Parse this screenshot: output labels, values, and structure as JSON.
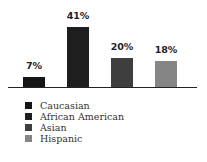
{
  "chart_data": {
    "type": "bar",
    "title": "",
    "xlabel": "",
    "ylabel": "",
    "categories": [
      "Caucasian",
      "African American",
      "Asian",
      "Hispanic"
    ],
    "values": [
      7,
      41,
      20,
      18
    ],
    "value_labels": [
      "7%",
      "41%",
      "20%",
      "18%"
    ],
    "colors": [
      "#151515",
      "#1e1e1e",
      "#3e3e3e",
      "#858585"
    ],
    "ylim": [
      0,
      45
    ],
    "grid": false,
    "legend_position": "bottom-left"
  },
  "legend": {
    "items": [
      {
        "label": "Caucasian",
        "color": "#151515"
      },
      {
        "label": "African American",
        "color": "#1e1e1e"
      },
      {
        "label": "Asian",
        "color": "#3e3e3e"
      },
      {
        "label": "Hispanic",
        "color": "#858585"
      }
    ]
  }
}
